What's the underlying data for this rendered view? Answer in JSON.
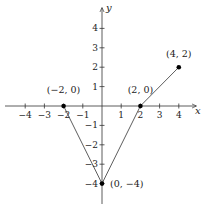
{
  "chart_data": {
    "type": "line",
    "title": "",
    "xlabel": "x",
    "ylabel": "y",
    "xlim": [
      -4.6,
      4.9
    ],
    "ylim": [
      -5.0,
      4.9
    ],
    "grid": false,
    "x_ticks": [
      -4,
      -3,
      -2,
      -1,
      1,
      2,
      3,
      4
    ],
    "y_ticks": [
      -4,
      -3,
      -2,
      -1,
      1,
      2,
      3,
      4
    ],
    "x_tick_labels": [
      "−4",
      "−3",
      "−2",
      "−1",
      "1",
      "2",
      "3",
      "4"
    ],
    "y_tick_labels": [
      "−4",
      "−3",
      "−2",
      "−1",
      "1",
      "2",
      "3",
      "4"
    ],
    "series": [
      {
        "name": "piecewise linear",
        "points": [
          [
            -2,
            0
          ],
          [
            0,
            -4
          ],
          [
            2,
            0
          ],
          [
            4,
            2
          ]
        ]
      }
    ],
    "marked_points": [
      {
        "x": -2,
        "y": 0,
        "label": "(−2, 0)"
      },
      {
        "x": 2,
        "y": 0,
        "label": "(2, 0)"
      },
      {
        "x": 4,
        "y": 2,
        "label": "(4, 2)"
      },
      {
        "x": 0,
        "y": -4,
        "label": "(0, −4)"
      }
    ]
  },
  "colors": {
    "axis": "#333333",
    "line": "#333333",
    "point": "#000000"
  }
}
